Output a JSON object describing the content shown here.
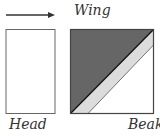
{
  "diagram": {
    "labels": {
      "wing": "Wing",
      "head": "Head",
      "beak": "Beak"
    },
    "arrow": {
      "direction": "right"
    },
    "shapes": {
      "left_box": "plain white rectangle",
      "right_box": "square divided diagonally into dark, light, and white regions"
    },
    "colors": {
      "outline": "#555555",
      "dark_fill": "#666666",
      "light_band": "#dcdcdc",
      "white": "#ffffff",
      "text": "#333333"
    }
  }
}
